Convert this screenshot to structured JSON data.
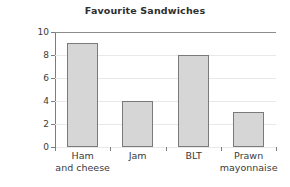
{
  "chart_data": {
    "type": "bar",
    "title": "Favourite Sandwiches",
    "xlabel": "",
    "ylabel": "Number of children",
    "categories": [
      "Ham and cheese",
      "Jam",
      "BLT",
      "Prawn mayonnaise"
    ],
    "category_lines": [
      {
        "line1": "Ham",
        "line2": "and cheese"
      },
      {
        "line1": "Jam",
        "line2": ""
      },
      {
        "line1": "BLT",
        "line2": ""
      },
      {
        "line1": "Prawn",
        "line2": "mayonnaise"
      }
    ],
    "values": [
      9,
      4,
      8,
      3
    ],
    "ylim": [
      0,
      10
    ],
    "ytick_labels": [
      "10",
      "8",
      "6",
      "4",
      "2",
      "0"
    ],
    "ytick_values": [
      10,
      8,
      6,
      4,
      2,
      0
    ],
    "grid": true,
    "legend": "none",
    "colors": {
      "bar_fill": "#d6d6d6",
      "bar_border": "#7a7a7a",
      "axis": "#7c7c7c",
      "gridline": "#e8e8e8",
      "top_rule": "#8d8d8d",
      "text": "#3a3a3a",
      "title_text": "#2e2e2e",
      "background": "#ffffff"
    }
  }
}
